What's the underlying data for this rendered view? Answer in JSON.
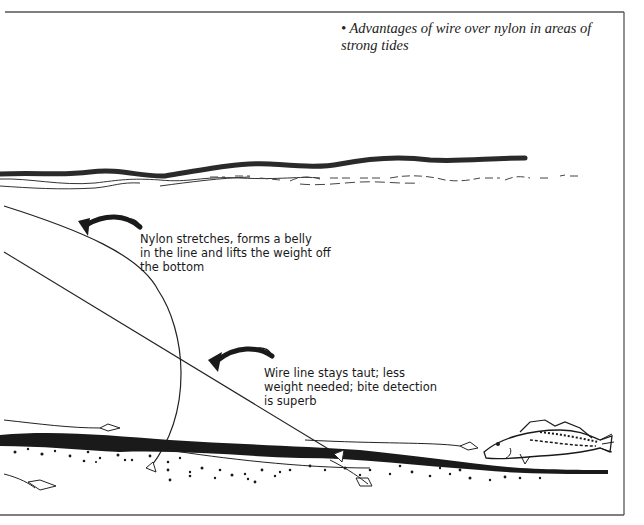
{
  "caption": {
    "bullet": "•",
    "text": "Advantages of wire over nylon in areas of strong tides"
  },
  "annotations": [
    {
      "id": "nylon",
      "text": "Nylon stretches, forms a belly\nin the line and lifts the weight off\nthe bottom"
    },
    {
      "id": "wire",
      "text": "Wire line stays taut; less\nweight needed; bite detection\nis superb"
    }
  ],
  "colors": {
    "ink": "#1a1a1a",
    "frame": "#555555",
    "background": "#ffffff"
  },
  "elements": {
    "sea_surface": "wavy-surface-line",
    "nylon_line": "curved-belly-line",
    "wire_line": "straight-taut-line",
    "seabed": "stippled-seabed",
    "fish": "cod-fish",
    "lures": "lure-icons",
    "weights": "sinker-weights",
    "arrows": "curved-pointer-arrows"
  }
}
